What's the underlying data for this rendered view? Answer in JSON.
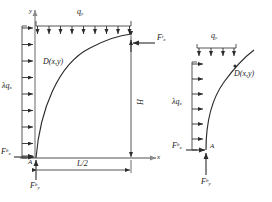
{
  "figure": {
    "type": "engineering-free-body-diagram",
    "stroke_color": "#2b2b2b",
    "axis_color": "#8a8a8a",
    "panels": [
      {
        "id": "left-panel",
        "name": "full-structure-diagram",
        "axis_x_label": "x",
        "axis_y_label": "y",
        "curve_label": "D(x,y)",
        "top_load_label": "q",
        "top_load_sub": "y",
        "side_load_label": "λq",
        "side_load_sub": "x",
        "point_label": "A",
        "dim_horizontal": "L/2",
        "dim_vertical": "H",
        "force_top_right": {
          "base": "F",
          "sub": "x",
          "sup": "t"
        },
        "force_left_bottom": {
          "base": "F",
          "sub": "x",
          "sup": "b"
        },
        "force_bottom": {
          "base": "F",
          "sub": "y",
          "sup": "b"
        },
        "top_arrow_count": 9,
        "side_arrow_count": 9
      },
      {
        "id": "right-panel",
        "name": "detail-structure-diagram",
        "curve_label": "D(x,y)",
        "top_load_label": "q",
        "top_load_sub": "y",
        "side_load_label": "λq",
        "side_load_sub": "x",
        "point_label": "A",
        "force_left_bottom": {
          "base": "F",
          "sub": "x",
          "sup": "b"
        },
        "force_bottom": {
          "base": "F",
          "sub": "y",
          "sup": "b"
        },
        "top_arrow_count": 4,
        "side_arrow_count": 6
      }
    ]
  }
}
